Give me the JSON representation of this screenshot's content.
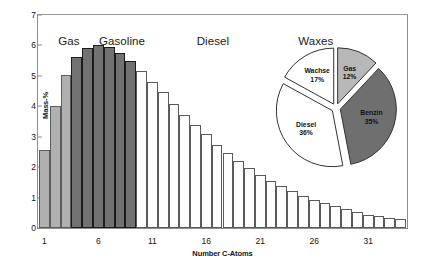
{
  "chart_data": [
    {
      "type": "bar",
      "title": "",
      "xlabel": "Number C-Atoms",
      "ylabel": "Mass-%",
      "xlim": [
        0.4,
        34.6
      ],
      "ylim": [
        0,
        7
      ],
      "ytick_labels": [
        "0",
        "1",
        "2",
        "3",
        "4",
        "5",
        "6",
        "7"
      ],
      "ytick_values": [
        0,
        1,
        2,
        3,
        4,
        5,
        6,
        7
      ],
      "xtick_labels": [
        "1",
        "6",
        "11",
        "16",
        "21",
        "26",
        "31"
      ],
      "xtick_values": [
        1,
        6,
        11,
        16,
        21,
        26,
        31
      ],
      "grid": false,
      "legend": "none",
      "categories": [
        1,
        2,
        3,
        4,
        5,
        6,
        7,
        8,
        9,
        10,
        11,
        12,
        13,
        14,
        15,
        16,
        17,
        18,
        19,
        20,
        21,
        22,
        23,
        24,
        25,
        26,
        27,
        28,
        29,
        30,
        31,
        32,
        33,
        34
      ],
      "values": [
        2.55,
        4.0,
        5.02,
        5.62,
        5.9,
        6.0,
        5.95,
        5.75,
        5.5,
        5.17,
        4.8,
        4.47,
        4.08,
        3.71,
        3.39,
        3.08,
        2.74,
        2.48,
        2.2,
        1.98,
        1.75,
        1.55,
        1.39,
        1.22,
        1.05,
        0.93,
        0.82,
        0.71,
        0.61,
        0.52,
        0.44,
        0.38,
        0.32,
        0.28
      ],
      "bar_groups": [
        {
          "name": "Gas",
          "from": 1,
          "to": 3,
          "class": "gas",
          "color": "#b0b0b0"
        },
        {
          "name": "Gasoline",
          "from": 4,
          "to": 9,
          "class": "gasoline",
          "color": "#727272"
        },
        {
          "name": "Heavy",
          "from": 10,
          "to": 34,
          "class": "heavy",
          "color": "#fdfdfd"
        }
      ],
      "annotations": [
        {
          "text": "Gas",
          "x_pct": 5.5,
          "y_px": 20
        },
        {
          "text": "Gasoline",
          "x_pct": 16.5,
          "y_px": 20
        },
        {
          "text": "Diesel",
          "x_pct": 43.0,
          "y_px": 20
        },
        {
          "text": "Waxes",
          "x_pct": 70.5,
          "y_px": 20
        }
      ]
    },
    {
      "type": "pie",
      "title": "",
      "labels": [
        "Gas",
        "Benzin",
        "Diesel",
        "Wachse"
      ],
      "values": [
        12,
        35,
        36,
        17
      ],
      "value_labels": [
        "12%",
        "35%",
        "36%",
        "17%"
      ],
      "colors": [
        "#b8b8b8",
        "#6f6f6f",
        "#ffffff",
        "#ffffff"
      ],
      "exploded": true,
      "legend": "none"
    }
  ]
}
